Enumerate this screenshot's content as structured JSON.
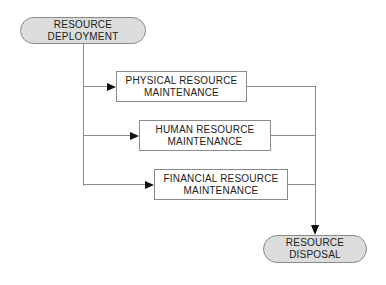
{
  "diagram": {
    "type": "flowchart",
    "nodes": [
      {
        "id": "resource-deployment",
        "shape": "stadium",
        "label_line1": "RESOURCE",
        "label_line2": "DEPLOYMENT"
      },
      {
        "id": "physical-resource-maintenance",
        "shape": "rect",
        "label_line1": "PHYSICAL RESOURCE",
        "label_line2": "MAINTENANCE"
      },
      {
        "id": "human-resource-maintenance",
        "shape": "rect",
        "label_line1": "HUMAN RESOURCE",
        "label_line2": "MAINTENANCE"
      },
      {
        "id": "financial-resource-maintenance",
        "shape": "rect",
        "label_line1": "FINANCIAL RESOURCE",
        "label_line2": "MAINTENANCE"
      },
      {
        "id": "resource-disposal",
        "shape": "stadium",
        "label_line1": "RESOURCE",
        "label_line2": "DISPOSAL"
      }
    ],
    "edges": [
      {
        "from": "resource-deployment",
        "to": "physical-resource-maintenance"
      },
      {
        "from": "resource-deployment",
        "to": "human-resource-maintenance"
      },
      {
        "from": "resource-deployment",
        "to": "financial-resource-maintenance"
      },
      {
        "from": "physical-resource-maintenance",
        "to": "resource-disposal"
      },
      {
        "from": "human-resource-maintenance",
        "to": "resource-disposal"
      },
      {
        "from": "financial-resource-maintenance",
        "to": "resource-disposal"
      }
    ],
    "colors": {
      "background": "#ffffff",
      "node_fill_terminal": "#dcdcdc",
      "node_fill_process": "#ffffff",
      "border": "#8a8a8a",
      "line": "#8a8a8a",
      "arrow": "#111111",
      "text": "#222222"
    }
  }
}
